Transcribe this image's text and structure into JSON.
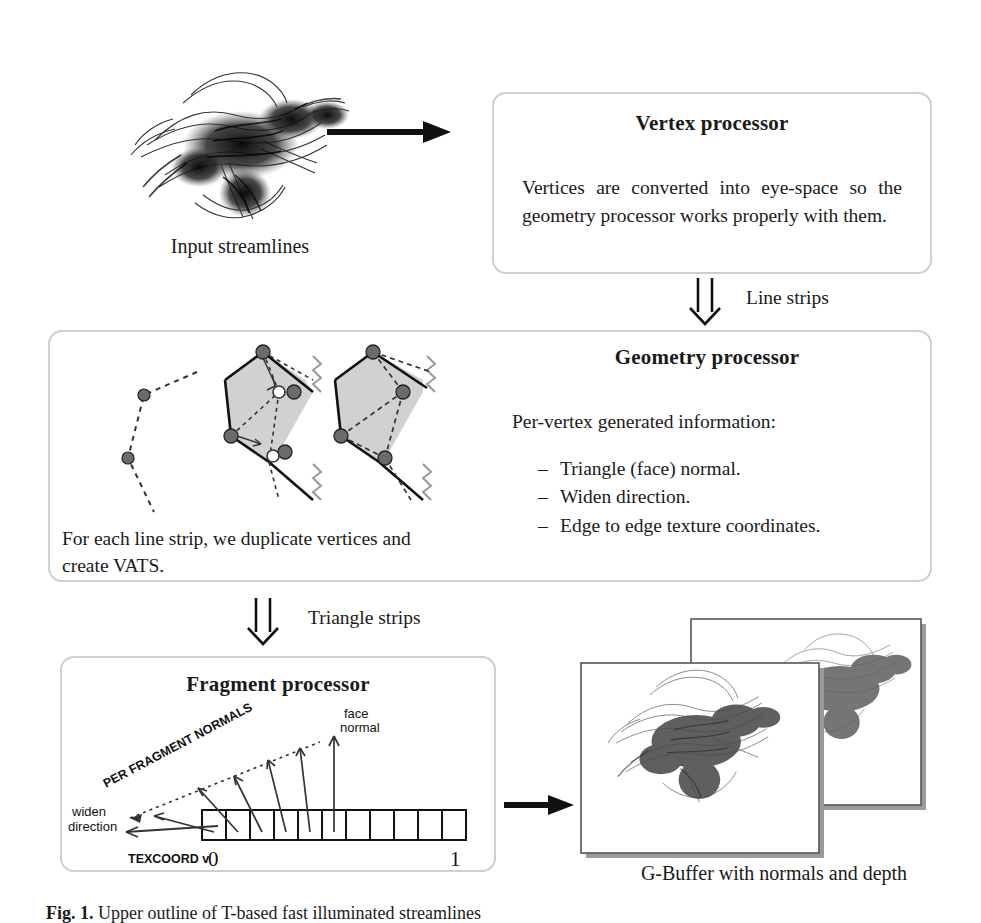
{
  "figure": {
    "caption_label": "Fig. 1.",
    "caption_text": "Upper outline of T-based fast illuminated streamlines"
  },
  "input": {
    "image_alt": "streamlines-render",
    "caption": "Input streamlines"
  },
  "vertex_stage": {
    "title": "Vertex processor",
    "body": "Vertices are converted into eye-space so the geometry processor works properly with them."
  },
  "geometry_stage": {
    "title": "Geometry processor",
    "intro": "Per-vertex generated information:",
    "bullets": [
      "Triangle (face) normal.",
      "Widen direction.",
      "Edge to edge texture coordinates."
    ],
    "diagram_caption": "For each line strip, we duplicate vertices and create VATS.",
    "diagram_alt": "line-strip-to-triangle-strip-diagram"
  },
  "fragment_stage": {
    "title": "Fragment processor",
    "labels": {
      "per_fragment_normals": "PER FRAGMENT NORMALS",
      "face_normal_line1": "face",
      "face_normal_line2": "normal",
      "widen_line1": "widen",
      "widen_line2": "direction",
      "texcoord": "TEXCOORD v",
      "texcoord_start": "0",
      "texcoord_end": "1"
    }
  },
  "output": {
    "caption": "G-Buffer with normals and depth",
    "image_alt": "g-buffer-normals-and-depth"
  },
  "connectors": {
    "input_to_vertex": "arrow-right",
    "vertex_to_geometry_label": "Line strips",
    "geometry_to_fragment_label": "Triangle strips",
    "fragment_to_output": "arrow-right"
  },
  "colors": {
    "box_border": "#cfcfcf",
    "ink": "#1a1a1a",
    "fill_gray": "#c9c9c9",
    "shadow": "#9a9a9a"
  }
}
